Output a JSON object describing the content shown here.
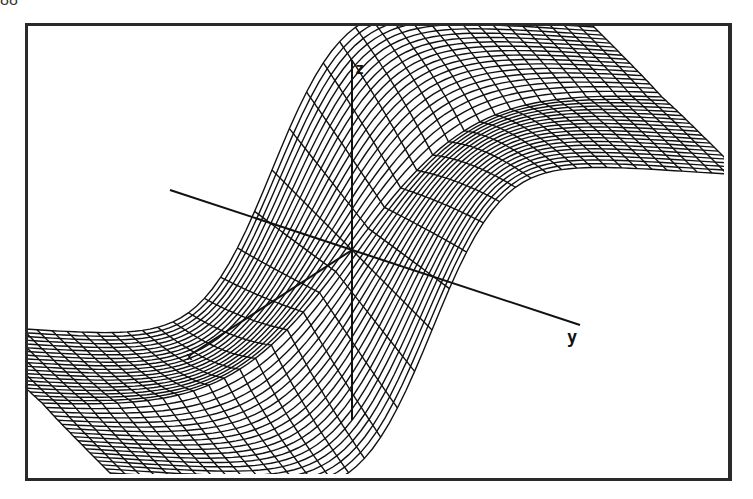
{
  "page": {
    "number_fragment": "88"
  },
  "chart_data": {
    "type": "surface",
    "style": "wireframe",
    "title": "",
    "axes": {
      "x": "x",
      "y": "y",
      "z": "z"
    },
    "grid": {
      "u_lines": 40,
      "v_lines": 40
    },
    "view": {
      "frame": [
        25,
        23,
        728,
        478
      ],
      "origin_px": [
        352,
        250
      ]
    },
    "axis_lines": {
      "z": {
        "from": [
          352,
          420
        ],
        "to": [
          352,
          60
        ]
      },
      "y": {
        "from": [
          170,
          190
        ],
        "to": [
          580,
          325
        ]
      },
      "x": {
        "from": [
          352,
          250
        ],
        "to": [
          190,
          355
        ]
      }
    },
    "colors": {
      "mesh": "#111111",
      "frame": "#2a2a2a",
      "background": "#ffffff"
    }
  }
}
